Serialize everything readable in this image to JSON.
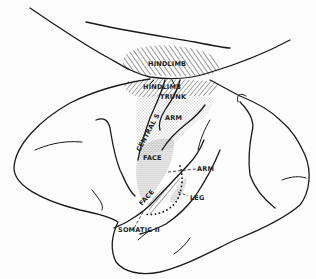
{
  "diagram": {
    "labels": {
      "hindlimb_upper": "HINDLIMB",
      "hindlimb_lower": "HINDLIMB",
      "trunk": "TRUNK",
      "arm_upper": "ARM",
      "central_sulcus": "CENTRAL S",
      "face_upper": "FACE",
      "face_lower": "FACE",
      "arm_lower": "ARM",
      "leg": "LEG",
      "somatic_ii": "SOMATIC II"
    },
    "colors": {
      "line": "#1a1a1a",
      "background": "#fdfdfd",
      "hatch": "#555555",
      "stipple": "#777777"
    }
  }
}
